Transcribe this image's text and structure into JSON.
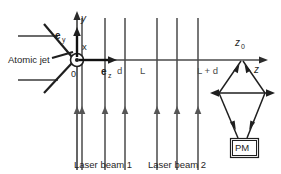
{
  "figure": {
    "background_color": "#ffffff",
    "line_color": "#2b2b2b",
    "beam_color": "#555555"
  },
  "labels": {
    "atomic_jet": "Atomic jet",
    "origin": "0",
    "axis_y": "y",
    "axis_z": "z",
    "axis_x": "x",
    "unit_vector_y_base": "e",
    "unit_vector_y_sub": "y",
    "unit_vector_z_base": "e",
    "unit_vector_z_sub": "z",
    "distance_d": "d",
    "distance_L": "L",
    "distance_L_plus_d": "L + d",
    "position_z0_base": "z",
    "position_z0_sub": "0",
    "laser_beam_1": "Laser beam 1",
    "laser_beam_2": "Laser beam 2",
    "detector": "PM"
  },
  "geometry": {
    "origin": {
      "x": 77,
      "y": 60
    },
    "axis_z_end": {
      "x": 266,
      "y": 60
    },
    "axis_y_top": {
      "x": 77,
      "y": 14
    },
    "axis_y_bottom": {
      "x": 77,
      "y": 170
    },
    "laser_beam_1_lines_x": [
      82,
      105,
      125
    ],
    "laser_beam_2_lines_x": [
      157,
      177,
      198
    ],
    "laser_line_top_y": 18,
    "laser_line_bottom_y": 170,
    "laser_arrow_y": 112,
    "detector_apex": {
      "x": 242,
      "y": 62
    },
    "detector_waist_y": 93,
    "detector_bottom": {
      "x": 242,
      "y": 138
    },
    "pm_box": {
      "x": 231,
      "y": 139,
      "width": 27,
      "height": 18
    },
    "transverse_arrow": {
      "x1": 212,
      "x2": 273,
      "y": 93
    }
  }
}
